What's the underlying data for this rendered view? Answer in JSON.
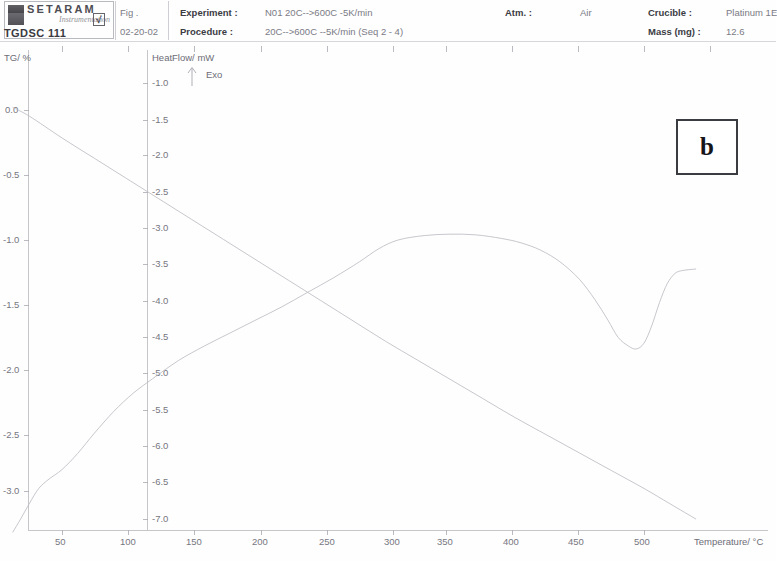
{
  "instrument": {
    "brand": "SETARAM",
    "script": "Instrumentation",
    "model": "TGDSC 111",
    "sqrt_glyph": "√"
  },
  "header": {
    "fig_label": "Fig .",
    "fig_value": "02-20-02",
    "fields": [
      {
        "key": "Experiment :",
        "value": "N01 20C-->600C -5K/min"
      },
      {
        "key": "Procedure :",
        "value": "20C-->600C --5K/min (Seq 2 - 4)"
      },
      {
        "key": "Atm. :",
        "value": "Air"
      },
      {
        "key": "Crucible :",
        "value": "Platinum 1E"
      },
      {
        "key": "Mass (mg) :",
        "value": "12.6"
      }
    ]
  },
  "panel": {
    "letter": "b"
  },
  "chart_data": {
    "type": "line",
    "title": "",
    "xlabel": "Temperature/ °C",
    "xlim": [
      12,
      545
    ],
    "xticks": [
      50,
      100,
      150,
      200,
      250,
      300,
      350,
      400,
      450,
      500
    ],
    "grid": false,
    "legend_position": "none",
    "exo_marker": "Exo",
    "axes": [
      {
        "id": "tg",
        "label": "TG/ %",
        "side": "left",
        "ylim": [
          -3.35,
          0.35
        ],
        "yticks": [
          0.0,
          -0.5,
          -1.0,
          -1.5,
          -2.0,
          -2.5,
          -3.0
        ],
        "yticklabels": [
          "0.0",
          "-0.5",
          "-1.0",
          "-1.5",
          "-2.0",
          "-2.5",
          "-3.0"
        ]
      },
      {
        "id": "dsc",
        "label": "HeatFlow/ mW",
        "side": "inner-left",
        "ylim": [
          -7.25,
          -0.78
        ],
        "yticks": [
          -1.0,
          -1.5,
          -2.0,
          -2.5,
          -3.0,
          -3.5,
          -4.0,
          -4.5,
          -5.0,
          -5.5,
          -6.0,
          -6.5,
          -7.0
        ],
        "yticklabels": [
          "-1.0",
          "-1.5",
          "-2.0",
          "-2.5",
          "-3.0",
          "-3.5",
          "-4.0",
          "-4.5",
          "-5.0",
          "-5.5",
          "-6.0",
          "-6.5",
          "-7.0"
        ]
      }
    ],
    "series": [
      {
        "name": "TG",
        "axis": "tg",
        "unit": "%",
        "color": "#b9b9c1",
        "x": [
          12,
          25,
          50,
          75,
          100,
          125,
          150,
          175,
          200,
          225,
          250,
          275,
          300,
          325,
          350,
          375,
          400,
          425,
          450,
          475,
          500,
          520,
          540
        ],
        "y": [
          0.02,
          -0.05,
          -0.22,
          -0.38,
          -0.54,
          -0.7,
          -0.86,
          -1.02,
          -1.18,
          -1.34,
          -1.5,
          -1.66,
          -1.82,
          -1.97,
          -2.12,
          -2.27,
          -2.42,
          -2.56,
          -2.7,
          -2.84,
          -2.98,
          -3.1,
          -3.22
        ]
      },
      {
        "name": "HeatFlow (DSC)",
        "axis": "dsc",
        "unit": "mW",
        "color": "#b9b9c1",
        "x": [
          12,
          18,
          25,
          32,
          40,
          50,
          62,
          75,
          90,
          105,
          120,
          140,
          160,
          180,
          200,
          220,
          240,
          260,
          280,
          295,
          310,
          330,
          350,
          370,
          390,
          405,
          420,
          435,
          450,
          462,
          472,
          480,
          488,
          494,
          500,
          506,
          512,
          518,
          524,
          530,
          540
        ],
        "y": [
          -7.18,
          -7.0,
          -6.78,
          -6.58,
          -6.45,
          -6.32,
          -6.1,
          -5.82,
          -5.52,
          -5.27,
          -5.07,
          -4.82,
          -4.62,
          -4.44,
          -4.26,
          -4.08,
          -3.88,
          -3.68,
          -3.46,
          -3.28,
          -3.16,
          -3.1,
          -3.08,
          -3.09,
          -3.14,
          -3.2,
          -3.3,
          -3.46,
          -3.7,
          -3.98,
          -4.26,
          -4.5,
          -4.62,
          -4.66,
          -4.58,
          -4.34,
          -4.02,
          -3.76,
          -3.62,
          -3.58,
          -3.56
        ]
      }
    ],
    "annotations": [
      {
        "text": "Exo",
        "type": "axis-direction-arrow",
        "near": "HeatFlow top"
      },
      {
        "text": "b",
        "type": "panel-label"
      }
    ]
  }
}
